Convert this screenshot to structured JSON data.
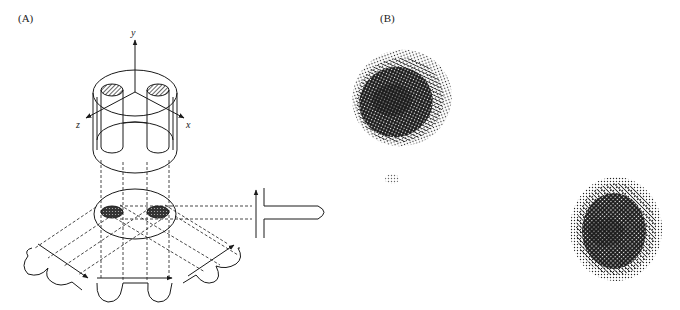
{
  "panels": {
    "a": {
      "label": "(A)",
      "axes": {
        "y": "y",
        "z": "z",
        "x": "x"
      },
      "description": "Cylindrical phantom with two rods projected onto a cross-section; parallel projections at several angles"
    },
    "b": {
      "label": "(B)",
      "description": "Reconstructed image showing two dense spots and a faint artifact"
    }
  },
  "colors": {
    "ink": "#1a1a1a",
    "background": "#ffffff"
  }
}
